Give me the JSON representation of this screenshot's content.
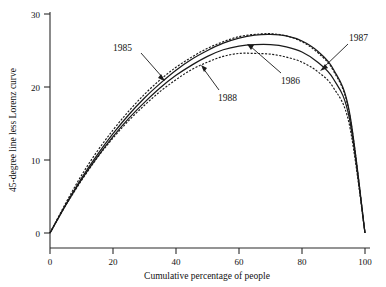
{
  "chart_data": {
    "type": "line",
    "title": "",
    "xlabel": "Cumulative percentage of people",
    "ylabel": "45-degree line less Lorenz curve",
    "xlim": [
      0,
      100
    ],
    "ylim": [
      0,
      30
    ],
    "xticks": [
      0,
      20,
      40,
      60,
      80,
      100
    ],
    "yticks": [
      0,
      10,
      20,
      30
    ],
    "xticklabels": [
      "0",
      "20",
      "40",
      "60",
      "80",
      "100"
    ],
    "yticklabels": [
      "0",
      "10",
      "20",
      "30"
    ],
    "grid": false,
    "legend_position": "inline-annotations",
    "x": [
      0,
      5,
      10,
      15,
      20,
      25,
      30,
      35,
      40,
      45,
      50,
      55,
      60,
      65,
      70,
      75,
      80,
      85,
      90,
      95,
      100
    ],
    "series": [
      {
        "name": "1985",
        "style": "dashed",
        "peak_x": 67,
        "peak_y": 27.3,
        "values": [
          0.0,
          4.1,
          7.9,
          11.2,
          14.1,
          16.7,
          19.0,
          21.0,
          22.7,
          24.1,
          25.3,
          26.2,
          26.9,
          27.2,
          27.3,
          27.0,
          26.2,
          24.7,
          22.2,
          16.5,
          0.0
        ]
      },
      {
        "name": "1987",
        "style": "solid",
        "peak_x": 68,
        "peak_y": 27.2,
        "values": [
          0.0,
          3.9,
          7.5,
          10.7,
          13.6,
          16.2,
          18.5,
          20.5,
          22.3,
          23.8,
          25.0,
          26.0,
          26.7,
          27.1,
          27.2,
          27.0,
          26.3,
          24.9,
          22.4,
          16.7,
          0.0
        ]
      },
      {
        "name": "1986",
        "style": "solid",
        "peak_x": 65,
        "peak_y": 25.8,
        "values": [
          0.0,
          3.8,
          7.3,
          10.4,
          13.2,
          15.7,
          17.9,
          19.9,
          21.6,
          23.0,
          24.2,
          25.1,
          25.6,
          25.8,
          25.8,
          25.5,
          24.8,
          23.4,
          21.1,
          15.8,
          0.0
        ]
      },
      {
        "name": "1988",
        "style": "dashed",
        "peak_x": 63,
        "peak_y": 24.6,
        "values": [
          0.0,
          3.8,
          7.2,
          10.3,
          13.0,
          15.4,
          17.5,
          19.4,
          21.0,
          22.4,
          23.4,
          24.2,
          24.6,
          24.6,
          24.5,
          24.1,
          23.4,
          22.1,
          19.9,
          14.9,
          0.0
        ]
      }
    ],
    "annotations": [
      {
        "label": "1985",
        "x": 20,
        "y": 24.0
      },
      {
        "label": "1987",
        "x": 96,
        "y": 28.0
      },
      {
        "label": "1986",
        "x": 73,
        "y": 20.3
      },
      {
        "label": "1988",
        "x": 54,
        "y": 18.0
      }
    ]
  }
}
